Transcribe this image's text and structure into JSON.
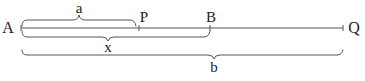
{
  "diagram": {
    "type": "line-segment-with-braces",
    "colors": {
      "line": "#555555",
      "text": "#222222",
      "background": "#ffffff"
    },
    "line": {
      "x1": 21,
      "x2": 343,
      "y": 28
    },
    "points": [
      {
        "id": "A",
        "label": "A",
        "x": 21,
        "label_x": 8,
        "label_y": 33
      },
      {
        "id": "P",
        "label": "P",
        "x": 139,
        "label_x": 143,
        "label_y": 22
      },
      {
        "id": "B",
        "label": "B",
        "x": 210,
        "label_x": 211,
        "label_y": 22
      },
      {
        "id": "Q",
        "label": "Q",
        "x": 343,
        "label_x": 353,
        "label_y": 33
      }
    ],
    "braces": [
      {
        "id": "a",
        "label": "a",
        "from": "A",
        "to": "P",
        "side": "above",
        "label_x": 79,
        "label_y": 12
      },
      {
        "id": "x",
        "label": "x",
        "from": "A",
        "to": "B",
        "side": "below",
        "label_x": 108,
        "label_y": 52
      },
      {
        "id": "b",
        "label": "b",
        "from": "A",
        "to": "Q",
        "side": "below",
        "label_x": 214,
        "label_y": 72
      }
    ]
  }
}
